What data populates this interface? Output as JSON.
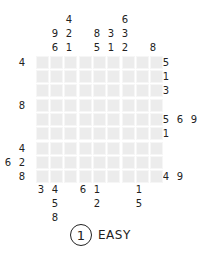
{
  "puzzle": {
    "grid_size": 9,
    "block_size": 3,
    "cell_color": "#ececec",
    "top_clues": [
      {
        "x": 55,
        "values": [
          "9",
          "6"
        ]
      },
      {
        "x": 69,
        "values": [
          "4",
          "2",
          "1"
        ]
      },
      {
        "x": 97,
        "values": [
          "8",
          "5"
        ]
      },
      {
        "x": 111,
        "values": [
          "3",
          "1"
        ]
      },
      {
        "x": 125,
        "values": [
          "6",
          "3",
          "2"
        ]
      },
      {
        "x": 153,
        "values": [
          "8"
        ]
      }
    ],
    "bottom_clues": [
      {
        "x": 41,
        "values": [
          "3"
        ]
      },
      {
        "x": 55,
        "values": [
          "4",
          "5",
          "8"
        ]
      },
      {
        "x": 83,
        "values": [
          "6"
        ]
      },
      {
        "x": 97,
        "values": [
          "1",
          "2"
        ]
      },
      {
        "x": 139,
        "values": [
          "1",
          "5"
        ]
      }
    ],
    "left_clues": [
      {
        "row": 0,
        "values": [
          "4"
        ]
      },
      {
        "row": 3,
        "values": [
          "8"
        ]
      },
      {
        "row": 6,
        "values": [
          "4"
        ]
      },
      {
        "row": 7,
        "values": [
          "6",
          "2"
        ]
      },
      {
        "row": 8,
        "values": [
          "8"
        ]
      }
    ],
    "right_clues": [
      {
        "row": 0,
        "values": [
          "5"
        ]
      },
      {
        "row": 1,
        "values": [
          "1"
        ]
      },
      {
        "row": 2,
        "values": [
          "3"
        ]
      },
      {
        "row": 4,
        "values": [
          "5",
          "6",
          "9"
        ]
      },
      {
        "row": 5,
        "values": [
          "1"
        ]
      },
      {
        "row": 8,
        "values": [
          "4",
          "9"
        ]
      }
    ]
  },
  "footer": {
    "level_number": "1",
    "difficulty": "EASY"
  }
}
